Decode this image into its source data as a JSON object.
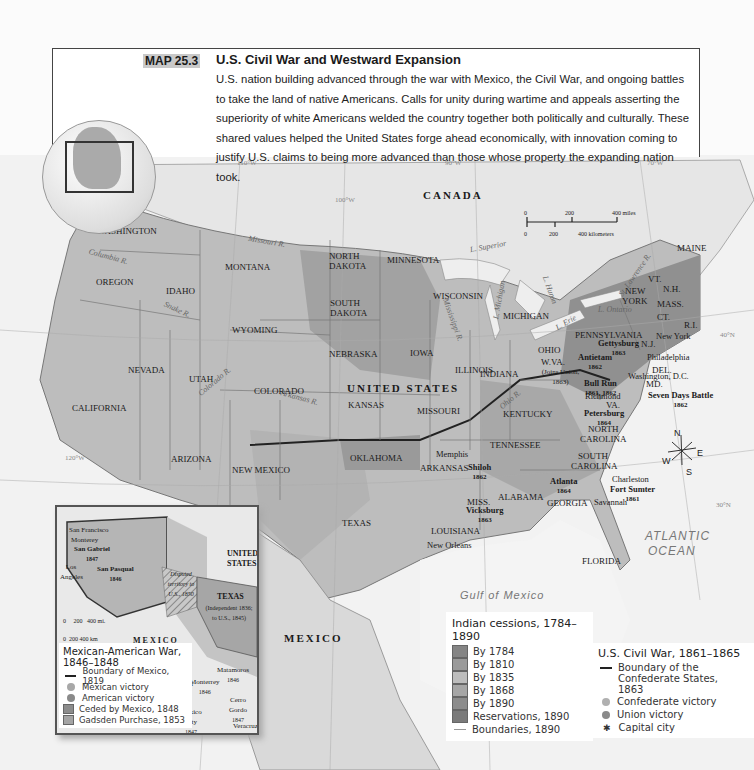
{
  "caption": {
    "tag": "MAP 25.3",
    "title": "U.S. Civil War and Westward Expansion",
    "description": "U.S. nation building advanced through the war with Mexico, the Civil War, and ongoing battles to take the land of native Americans. Calls for unity during wartime and appeals asserting the superiority of white Americans welded the country together both politically and culturally. These shared values helped the United States forge ahead economically, with innovation coming to justify U.S. claims to being more advanced than those whose property the expanding nation took."
  },
  "map": {
    "countries": {
      "canada": "CANADA",
      "us": "UNITED STATES",
      "mexico": "MEXICO"
    },
    "water": {
      "gulf": "Gulf of Mexico",
      "atlantic_1": "ATLANTIC",
      "atlantic_2": "OCEAN"
    },
    "meridians": [
      "110°W",
      "100°W",
      "90°W",
      "70°W",
      "120°W",
      "40°N",
      "30°N"
    ],
    "rivers": [
      "Columbia R.",
      "Snake R.",
      "Missouri R.",
      "Colorado R.",
      "Arkansas R.",
      "Mississippi R.",
      "Ohio R.",
      "St. Lawrence R."
    ],
    "lakes": [
      "L. Superior",
      "L. Michigan",
      "L. Huron",
      "L. Erie",
      "L. Ontario"
    ],
    "states": {
      "washington": "WASHINGTON",
      "oregon": "OREGON",
      "california": "CALIFORNIA",
      "nevada": "NEVADA",
      "idaho": "IDAHO",
      "montana": "MONTANA",
      "wyoming": "WYOMING",
      "utah": "UTAH",
      "colorado": "COLORADO",
      "arizona": "ARIZONA",
      "new_mexico": "NEW MEXICO",
      "north_dakota_1": "NORTH",
      "north_dakota_2": "DAKOTA",
      "south_dakota_1": "SOUTH",
      "south_dakota_2": "DAKOTA",
      "nebraska": "NEBRASKA",
      "kansas": "KANSAS",
      "oklahoma": "OKLAHOMA",
      "texas": "TEXAS",
      "minnesota": "MINNESOTA",
      "iowa": "IOWA",
      "missouri": "MISSOURI",
      "arkansas": "ARKANSAS",
      "louisiana": "LOUISIANA",
      "wisconsin": "WISCONSIN",
      "illinois": "ILLINOIS",
      "michigan": "MICHIGAN",
      "indiana": "INDIANA",
      "ohio": "OHIO",
      "kentucky": "KENTUCKY",
      "tennessee": "TENNESSEE",
      "miss": "MISS.",
      "alabama": "ALABAMA",
      "georgia": "GEORGIA",
      "florida": "FLORIDA",
      "south_carolina_1": "SOUTH",
      "south_carolina_2": "CAROLINA",
      "north_carolina_1": "NORTH",
      "north_carolina_2": "CAROLINA",
      "virginia": "VA.",
      "wva": "W.VA.",
      "wva_note": "(Joins Union, 1863)",
      "maryland": "MD.",
      "delaware": "DEL.",
      "pennsylvania": "PENNSYLVANIA",
      "nj": "N.J.",
      "new_york_1": "NEW",
      "new_york_2": "YORK",
      "vt": "VT.",
      "nh": "N.H.",
      "mass": "MASS.",
      "ct": "CT.",
      "ri": "R.I.",
      "maine": "MAINE"
    },
    "cities": {
      "new_york": "New York",
      "philadelphia": "Philadelphia",
      "washington_dc": "Washington, D.C.",
      "richmond": "Richmond",
      "memphis": "Memphis",
      "new_orleans": "New Orleans",
      "charleston": "Charleston",
      "savannah": "Savannah"
    },
    "battles": [
      {
        "name": "Gettysburg",
        "year": "1863"
      },
      {
        "name": "Antietam",
        "year": "1862"
      },
      {
        "name": "Bull Run",
        "year": "1861, 1862"
      },
      {
        "name": "Seven Days Battle",
        "year": "1862"
      },
      {
        "name": "Petersburg",
        "year": "1864"
      },
      {
        "name": "Shiloh",
        "year": "1862"
      },
      {
        "name": "Vicksburg",
        "year": "1863"
      },
      {
        "name": "Atlanta",
        "year": "1864"
      },
      {
        "name": "Fort Sumter",
        "year": "1861"
      }
    ],
    "scale": {
      "miles": [
        "0",
        "200",
        "400 miles"
      ],
      "km": [
        "0",
        "200",
        "400 kilometers"
      ]
    },
    "compass": {
      "n": "N",
      "s": "S",
      "e": "E",
      "w": "W"
    }
  },
  "inset": {
    "places": {
      "san_francisco": "San Francisco",
      "monterey": "Monterey",
      "san_gabriel": "San Gabriel",
      "san_gabriel_year": "1847",
      "los_angeles": "Los Angeles",
      "san_pasqual": "San Pasqual",
      "san_pasqual_year": "1846",
      "disputed": "Disputed territory to U.S., 1850",
      "texas": "TEXAS",
      "texas_note": "(Independent 1836; to U.S., 1845)",
      "united_states_1": "UNITED",
      "united_states_2": "STATES",
      "mexico": "MEXICO",
      "matamoros": "Matamoros",
      "matamoros_year": "1846",
      "monterrey": "Monterrey",
      "monterrey_year": "1846",
      "buena_vista": "Buena Vista",
      "buena_vista_year": "1847",
      "cerro_gordo": "Cerro Gordo",
      "cerro_gordo_year": "1847",
      "mexico_city": "Mexico City",
      "mexico_city_year": "1847",
      "veracruz": "Veracruz"
    },
    "meridians": [
      "120°W",
      "110°W",
      "100°W",
      "40°N"
    ],
    "scale": {
      "miles": [
        "0",
        "200",
        "400 mi."
      ],
      "km": [
        "0",
        "200",
        "400 km"
      ]
    },
    "legend": {
      "title": "Mexican-American War, 1846–1848",
      "items": [
        {
          "label": "Boundary of Mexico, 1819",
          "kind": "line"
        },
        {
          "label": "Mexican victory",
          "kind": "dot",
          "color": "#a8a8a8"
        },
        {
          "label": "American victory",
          "kind": "dot",
          "color": "#8a8a8a"
        },
        {
          "label": "Ceded by Mexico, 1848",
          "kind": "swatch",
          "color": "#8c8c8c"
        },
        {
          "label": "Gadsden Purchase, 1853",
          "kind": "swatch",
          "color": "#a4a4a4"
        }
      ]
    }
  },
  "legend_cessions": {
    "title": "Indian cessions, 1784–1890",
    "items": [
      {
        "label": "By 1784",
        "color": "#858585"
      },
      {
        "label": "By 1810",
        "color": "#9a9a9a"
      },
      {
        "label": "By 1835",
        "color": "#bdbdbd"
      },
      {
        "label": "By 1868",
        "color": "#a6a6a6"
      },
      {
        "label": "By 1890",
        "color": "#8c8c8c"
      },
      {
        "label": "Reservations, 1890",
        "color": "#7a7a7a"
      },
      {
        "label": "Boundaries, 1890",
        "kind": "line"
      }
    ]
  },
  "legend_civil_war": {
    "title": "U.S. Civil War, 1861–1865",
    "items": [
      {
        "label": "Boundary of the Confederate States, 1863",
        "kind": "line"
      },
      {
        "label": "Confederate victory",
        "kind": "dot",
        "color": "#b0b0b0"
      },
      {
        "label": "Union victory",
        "kind": "dot",
        "color": "#8a8a8a"
      },
      {
        "label": "Capital city",
        "kind": "star"
      }
    ]
  }
}
